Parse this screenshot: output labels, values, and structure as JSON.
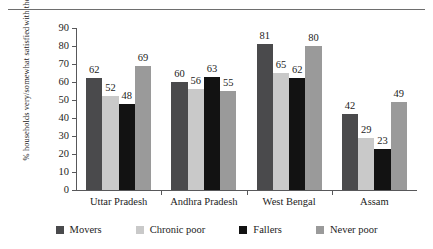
{
  "chart_data": {
    "type": "bar",
    "title": "",
    "xlabel": "",
    "ylabel": "% households very/somewhat satisfied with their local democracy",
    "ylabel_line1": "% households very/somewhat satisfied",
    "ylabel_line2": "with their local democracy",
    "ylim": [
      0,
      90
    ],
    "ytick_step": 10,
    "yticks": [
      0,
      10,
      20,
      30,
      40,
      50,
      60,
      70,
      80,
      90
    ],
    "grid": false,
    "legend_position": "bottom",
    "categories": [
      "Uttar Pradesh",
      "Andhra Pradesh",
      "West Bengal",
      "Assam"
    ],
    "series": [
      {
        "name": "Movers",
        "color": "#4a4a4c",
        "values": [
          62,
          60,
          81,
          42
        ]
      },
      {
        "name": "Chronic poor",
        "color": "#c9c9c9",
        "values": [
          52,
          56,
          65,
          29
        ]
      },
      {
        "name": "Fallers",
        "color": "#121212",
        "values": [
          48,
          63,
          62,
          23
        ]
      },
      {
        "name": "Never poor",
        "color": "#9a9a9a",
        "values": [
          69,
          55,
          80,
          49
        ]
      }
    ]
  }
}
